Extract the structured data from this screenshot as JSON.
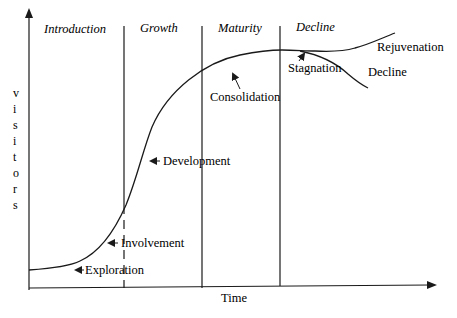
{
  "diagram": {
    "type": "tourism-area-life-cycle",
    "x_axis_label": "Time",
    "y_axis_label_letters": [
      "v",
      "i",
      "s",
      "i",
      "t",
      "o",
      "r",
      "s"
    ],
    "y_axis_label": "visitors",
    "stages": [
      {
        "label": "Introduction"
      },
      {
        "label": "Growth"
      },
      {
        "label": "Maturity"
      },
      {
        "label": "Decline"
      }
    ],
    "phase_labels": {
      "exploration": "Exploration",
      "involvement": "Involvement",
      "development": "Development",
      "consolidation": "Consolidation",
      "stagnation": "Stagnation",
      "rejuvenation": "Rejuvenation",
      "decline": "Decline"
    },
    "colors": {
      "line": "#1a1a1a",
      "background": "#ffffff"
    }
  }
}
